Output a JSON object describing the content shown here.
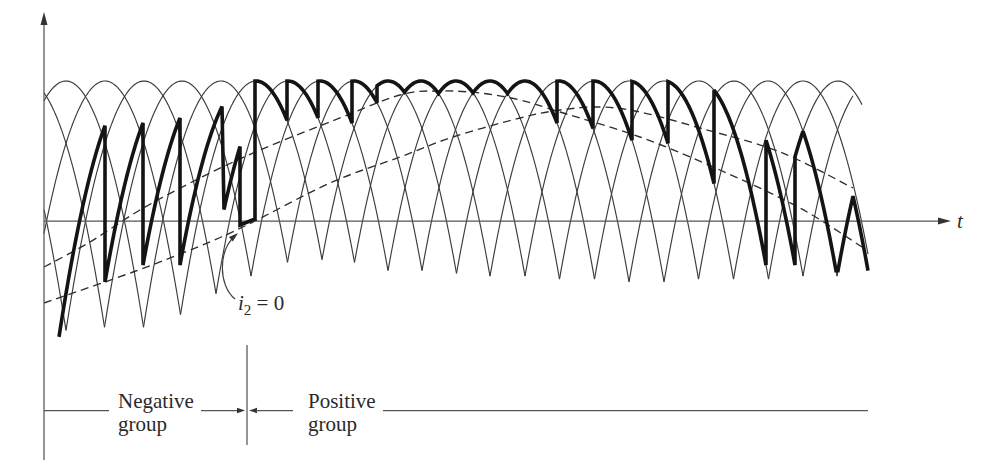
{
  "figure": {
    "axes": {
      "origin_x": 44,
      "origin_y": 221,
      "y_top": 12,
      "y_bottom": 460,
      "x_right": 951,
      "x_label": "t"
    },
    "arch_params": {
      "top_y": 81,
      "curvature": 0.041,
      "clip_xmin": 44,
      "clip_xmax": 868,
      "left_default": 80,
      "right_default": 68.4
    },
    "arches": [
      {
        "p": -12
      },
      {
        "p": 27
      },
      {
        "p": 66
      },
      {
        "p": 105
      },
      {
        "p": 144
      },
      {
        "p": 182
      },
      {
        "p": 221
      },
      {
        "p": 256
      },
      {
        "p": 288
      },
      {
        "p": 320
      },
      {
        "p": 354
      },
      {
        "p": 388
      },
      {
        "p": 421
      },
      {
        "p": 456
      },
      {
        "p": 490
      },
      {
        "p": 525
      },
      {
        "p": 559
      },
      {
        "p": 594
      },
      {
        "p": 629
      },
      {
        "p": 664
      },
      {
        "p": 699
      },
      {
        "p": 734
      },
      {
        "p": 768
      },
      {
        "p": 803
      },
      {
        "p": 838,
        "xmax": 862
      },
      {
        "p": 872,
        "xmax": 853
      },
      {
        "p": 906,
        "xmax": 853
      }
    ],
    "output_waveform": [
      {
        "p": 138,
        "x1": 59,
        "x2": 105
      },
      {
        "p": 175,
        "x1": 105,
        "x2": 143
      },
      {
        "p": 210,
        "x1": 143,
        "x2": 180
      },
      {
        "p": 247,
        "x1": 180,
        "x2": 222
      },
      {
        "p": 280,
        "x1": 224,
        "x2": 240
      },
      {
        "line": [
          [
            240,
            225
          ],
          [
            255,
            219
          ]
        ]
      },
      {
        "p": 256,
        "x1": 255,
        "x2": 287
      },
      {
        "p": 288,
        "x1": 287,
        "x2": 318
      },
      {
        "p": 320,
        "x1": 318,
        "x2": 352
      },
      {
        "p": 354,
        "x1": 352,
        "x2": 377
      },
      {
        "p": 388,
        "x1": 377,
        "x2": 404.5
      },
      {
        "p": 421,
        "x1": 404.5,
        "x2": 438.5
      },
      {
        "p": 456,
        "x1": 438.5,
        "x2": 473
      },
      {
        "p": 490,
        "x1": 473,
        "x2": 507.5
      },
      {
        "p": 525,
        "x1": 507.5,
        "x2": 557
      },
      {
        "p": 559,
        "x1": 557,
        "x2": 593
      },
      {
        "p": 594,
        "x1": 593,
        "x2": 632
      },
      {
        "p": 629,
        "x1": 632,
        "x2": 668
      },
      {
        "p": 664,
        "x1": 668,
        "x2": 714
      },
      {
        "p": 699,
        "x1": 714,
        "x2": 766
      },
      {
        "p": 728,
        "x1": 766,
        "x2": 795
      },
      {
        "p": 838,
        "x1": 795,
        "x2": 803
      },
      {
        "p": 768,
        "x1": 803,
        "x2": 836
      },
      {
        "p": 906,
        "x1": 838,
        "x2": 853
      },
      {
        "p": 800,
        "x1": 853,
        "x2": 868
      }
    ],
    "reference_curves": [
      {
        "name": "reference-signal-a",
        "points": [
          [
            44,
            267
          ],
          [
            90,
            242
          ],
          [
            140,
            210
          ],
          [
            200,
            178
          ],
          [
            260,
            150
          ],
          [
            330,
            122
          ],
          [
            400,
            95
          ],
          [
            440,
            91
          ],
          [
            480,
            93
          ],
          [
            520,
            100
          ],
          [
            560,
            112
          ],
          [
            640,
            137
          ],
          [
            720,
            170
          ],
          [
            800,
            208
          ],
          [
            862,
            247
          ]
        ]
      },
      {
        "name": "reference-signal-b",
        "points": [
          [
            44,
            303
          ],
          [
            133,
            272
          ],
          [
            200,
            246
          ],
          [
            247,
            225
          ],
          [
            330,
            183
          ],
          [
            400,
            157
          ],
          [
            453,
            137
          ],
          [
            520,
            118
          ],
          [
            560,
            110
          ],
          [
            600,
            107
          ],
          [
            640,
            112
          ],
          [
            700,
            128
          ],
          [
            780,
            152
          ],
          [
            853,
            188
          ]
        ]
      }
    ],
    "annotation": {
      "var": "i",
      "sub": "2",
      "rest": " = 0"
    }
  },
  "groups": {
    "negative": {
      "line1": "Negative",
      "line2": "group"
    },
    "positive": {
      "line1": "Positive",
      "line2": "group"
    }
  },
  "colors": {
    "thin_curve": "#3c3c3c",
    "output_waveform": "#141414",
    "reference_dashed": "#2e2e2e",
    "axis": "#555555",
    "background": "#ffffff"
  }
}
